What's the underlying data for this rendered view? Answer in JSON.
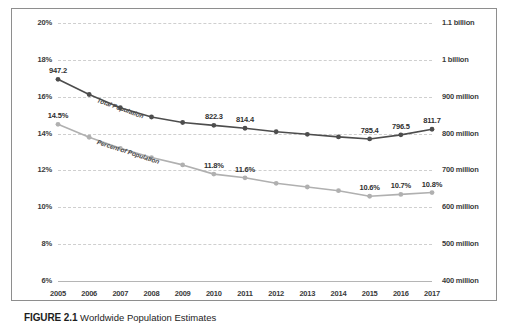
{
  "caption": {
    "label": "FIGURE 2.1",
    "text": "Worldwide Population Estimates"
  },
  "chart_data": {
    "type": "line",
    "title": "",
    "xlabel": "",
    "grid": true,
    "legend_position": "inline-on-series",
    "categories": [
      "2005",
      "2006",
      "2007",
      "2008",
      "2009",
      "2010",
      "2011",
      "2012",
      "2013",
      "2014",
      "2015",
      "2016",
      "2017"
    ],
    "axes": {
      "left": {
        "label": "Percent of Population",
        "ylim": [
          6,
          20
        ],
        "ticks": [
          "6%",
          "8%",
          "10%",
          "12%",
          "14%",
          "16%",
          "18%",
          "20%"
        ],
        "tick_values": [
          6,
          8,
          10,
          12,
          14,
          16,
          18,
          20
        ]
      },
      "right": {
        "label": "Total Population",
        "ylim": [
          400,
          1100
        ],
        "ticks": [
          "400 million",
          "500 million",
          "600 million",
          "700 million",
          "800 million",
          "900 million",
          "1 billion",
          "1.1 billion"
        ],
        "tick_values": [
          400,
          500,
          600,
          700,
          800,
          900,
          1000,
          1100
        ]
      }
    },
    "series": [
      {
        "name": "Total Population",
        "axis": "right",
        "color": "#4d4d4d",
        "values": [
          947.2,
          906.0,
          870.0,
          845.0,
          830.0,
          822.3,
          814.4,
          805.0,
          798.0,
          791.0,
          785.4,
          796.5,
          811.7
        ],
        "labels": [
          "947.2",
          "",
          "",
          "",
          "",
          "822.3",
          "814.4",
          "",
          "",
          "",
          "785.4",
          "796.5",
          "811.7"
        ]
      },
      {
        "name": "Percent of Population",
        "axis": "left",
        "color": "#b0b0b0",
        "values": [
          14.5,
          13.8,
          13.2,
          12.7,
          12.3,
          11.8,
          11.6,
          11.3,
          11.1,
          10.9,
          10.6,
          10.7,
          10.8
        ],
        "labels": [
          "14.5%",
          "",
          "",
          "",
          "",
          "11.8%",
          "11.6%",
          "",
          "",
          "",
          "10.6%",
          "10.7%",
          "10.8%"
        ]
      }
    ]
  }
}
